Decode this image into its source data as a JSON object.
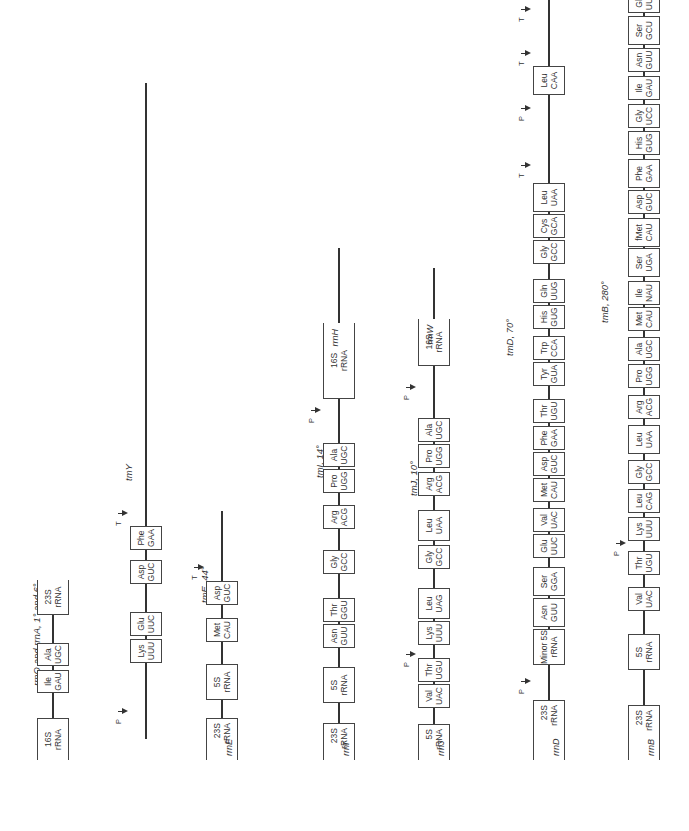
{
  "figure": {
    "operons": [
      {
        "id": "rrnO_rrnA",
        "caption": "rrnO and rrnA, 1° and 6°",
        "caption_x": 145,
        "caption_y": 37,
        "axis_y": 53,
        "line": [
          71,
          251
        ],
        "boxes": [
          {
            "l1": "16S",
            "l2": "rRNA",
            "x": 71,
            "w": 42,
            "open": "left"
          },
          {
            "l1": "Ile",
            "l2": "GAU",
            "x": 138,
            "w": 23
          },
          {
            "l1": "Ala",
            "l2": "UGC",
            "x": 165,
            "w": 23
          },
          {
            "l1": "23S",
            "l2": "rRNA",
            "x": 216,
            "w": 35,
            "open": "right"
          }
        ],
        "markers": []
      },
      {
        "id": "rrnY",
        "caption": "tmY",
        "caption_x": 350,
        "caption_y": 129,
        "axis_y": 146,
        "line": [
          92,
          748
        ],
        "boxes": [
          {
            "l1": "Lys",
            "l2": "UUU",
            "x": 168,
            "w": 24
          },
          {
            "l1": "Glu",
            "l2": "UUC",
            "x": 195,
            "w": 24
          },
          {
            "l1": "Asp",
            "l2": "GUC",
            "x": 247,
            "w": 24
          },
          {
            "l1": "Phe",
            "l2": "GAA",
            "x": 281,
            "w": 24
          }
        ],
        "markers": [
          {
            "type": "P",
            "x": 119
          },
          {
            "type": "T",
            "x": 317
          }
        ]
      },
      {
        "id": "rrnE",
        "caption": "tmE, 44°",
        "caption_x": 228,
        "caption_y": 205,
        "axis_y": 222,
        "line": [
          71,
          320
        ],
        "boxes": [
          {
            "l1": "23S",
            "l2": "rRNA",
            "x": 71,
            "w": 42,
            "open": "left",
            "name": "rrnE"
          },
          {
            "l1": "5S",
            "l2": "rRNA",
            "x": 131,
            "w": 36
          },
          {
            "l1": "Met",
            "l2": "CAU",
            "x": 189,
            "w": 24
          },
          {
            "l1": "Asp",
            "l2": "GUC",
            "x": 226,
            "w": 24
          }
        ],
        "markers": [
          {
            "type": "T",
            "x": 263
          }
        ]
      },
      {
        "id": "rrnI",
        "caption": "tmI, 14°",
        "caption_x": 353,
        "caption_y": 320,
        "axis_y": 339,
        "line": [
          71,
          583
        ],
        "boxes": [
          {
            "l1": "23S",
            "l2": "rRNA",
            "x": 71,
            "w": 37,
            "open": "left",
            "name": "rrnI"
          },
          {
            "l1": "5S",
            "l2": "rRNA",
            "x": 128,
            "w": 36
          },
          {
            "l1": "Asn",
            "l2": "GUU",
            "x": 183,
            "w": 24
          },
          {
            "l1": "Thr",
            "l2": "GGU",
            "x": 209,
            "w": 24
          },
          {
            "l1": "Gly",
            "l2": "GCC",
            "x": 257,
            "w": 24
          },
          {
            "l1": "Arg",
            "l2": "ACG",
            "x": 302,
            "w": 24
          },
          {
            "l1": "Pro",
            "l2": "UGG",
            "x": 338,
            "w": 24
          },
          {
            "l1": "Ala",
            "l2": "UGC",
            "x": 364,
            "w": 24
          }
        ],
        "markers": [
          {
            "type": "P",
            "x": 420
          }
        ],
        "tail_box": {
          "l1": "16S",
          "l2": "rRNA",
          "x": 432,
          "w": 76,
          "open": "right",
          "name": "rrnH"
        }
      },
      {
        "id": "rrnJ",
        "caption": "tmJ, 10°",
        "caption_x": 335,
        "caption_y": 414,
        "axis_y": 434,
        "line": [
          71,
          563
        ],
        "boxes": [
          {
            "l1": "5S",
            "l2": "rRNA",
            "x": 71,
            "w": 36,
            "open": "left",
            "name": "rrnJ"
          },
          {
            "l1": "Val",
            "l2": "UAC",
            "x": 123,
            "w": 24
          },
          {
            "l1": "Thr",
            "l2": "UGU",
            "x": 149,
            "w": 24
          },
          {
            "l1": "Lys",
            "l2": "UUU",
            "x": 186,
            "w": 24
          },
          {
            "l1": "Leu",
            "l2": "UAG",
            "x": 212,
            "w": 31
          },
          {
            "l1": "Gly",
            "l2": "GCC",
            "x": 262,
            "w": 24
          },
          {
            "l1": "Leu",
            "l2": "UAA",
            "x": 290,
            "w": 31
          },
          {
            "l1": "Arg",
            "l2": "ACG",
            "x": 335,
            "w": 24
          },
          {
            "l1": "Pro",
            "l2": "UGG",
            "x": 363,
            "w": 24
          },
          {
            "l1": "Ala",
            "l2": "UGC",
            "x": 389,
            "w": 24
          }
        ],
        "markers": [
          {
            "type": "P",
            "x": 176
          },
          {
            "type": "P",
            "x": 443
          }
        ],
        "tail_box": {
          "l1": "16S",
          "l2": "rRNA",
          "x": 465,
          "w": 47,
          "open": "right",
          "name": "rrnW"
        }
      },
      {
        "id": "rrnD",
        "caption": "tmD, 70°",
        "caption_x": 475,
        "caption_y": 510,
        "axis_y": 549,
        "line": [
          71,
          831
        ],
        "boxes": [
          {
            "l1": "23S",
            "l2": "rRNA",
            "x": 71,
            "w": 60,
            "open": "left",
            "name": "rrnD"
          },
          {
            "l1": "Minor 5S",
            "l2": "rRNA",
            "x": 166,
            "w": 36
          },
          {
            "l1": "Asn",
            "l2": "GUU",
            "x": 204,
            "w": 29
          },
          {
            "l1": "Ser",
            "l2": "GGA",
            "x": 235,
            "w": 29
          },
          {
            "l1": "Glu",
            "l2": "UUC",
            "x": 273,
            "w": 24
          },
          {
            "l1": "Val",
            "l2": "UAC",
            "x": 299,
            "w": 24
          },
          {
            "l1": "Met",
            "l2": "CAU",
            "x": 329,
            "w": 24
          },
          {
            "l1": "Asp",
            "l2": "GUC",
            "x": 355,
            "w": 24
          },
          {
            "l1": "Phe",
            "l2": "GAA",
            "x": 381,
            "w": 24
          },
          {
            "l1": "Thr",
            "l2": "UGU",
            "x": 408,
            "w": 24
          },
          {
            "l1": "Tyr",
            "l2": "GUA",
            "x": 445,
            "w": 24
          },
          {
            "l1": "Trp",
            "l2": "CCA",
            "x": 471,
            "w": 24
          },
          {
            "l1": "His",
            "l2": "GUG",
            "x": 502,
            "w": 24
          },
          {
            "l1": "Gln",
            "l2": "UUG",
            "x": 528,
            "w": 24
          },
          {
            "l1": "Gly",
            "l2": "GCC",
            "x": 567,
            "w": 24
          },
          {
            "l1": "Cys",
            "l2": "GCA",
            "x": 593,
            "w": 24
          },
          {
            "l1": "Leu",
            "l2": "UAA",
            "x": 619,
            "w": 29
          },
          {
            "l1": "Leu",
            "l2": "CAA",
            "x": 736,
            "w": 29
          }
        ],
        "markers": [
          {
            "type": "P",
            "x": 149
          },
          {
            "type": "T",
            "x": 665
          },
          {
            "type": "P",
            "x": 722
          },
          {
            "type": "T",
            "x": 777
          },
          {
            "type": "T",
            "x": 821
          }
        ]
      },
      {
        "id": "rrnB",
        "caption": "tmB, 280°",
        "caption_x": 508,
        "caption_y": 605,
        "axis_y": 644,
        "line": [
          71,
          831
        ],
        "boxes": [
          {
            "l1": "23S",
            "l2": "rRNA",
            "x": 71,
            "w": 55,
            "open": "left",
            "name": "rrnB"
          },
          {
            "l1": "5S",
            "l2": "rRNA",
            "x": 161,
            "w": 36
          },
          {
            "l1": "Val",
            "l2": "UAC",
            "x": 220,
            "w": 24
          },
          {
            "l1": "Thr",
            "l2": "UGU",
            "x": 256,
            "w": 24
          },
          {
            "l1": "Lys",
            "l2": "UUU",
            "x": 290,
            "w": 24
          },
          {
            "l1": "Leu",
            "l2": "CAG",
            "x": 318,
            "w": 24
          },
          {
            "l1": "Gly",
            "l2": "GCC",
            "x": 347,
            "w": 24
          },
          {
            "l1": "Leu",
            "l2": "UAA",
            "x": 377,
            "w": 29
          },
          {
            "l1": "Arg",
            "l2": "ACG",
            "x": 412,
            "w": 24
          },
          {
            "l1": "Pro",
            "l2": "UGG",
            "x": 443,
            "w": 24
          },
          {
            "l1": "Ala",
            "l2": "UGC",
            "x": 470,
            "w": 24
          },
          {
            "l1": "Met",
            "l2": "CAU",
            "x": 500,
            "w": 24
          },
          {
            "l1": "Ile",
            "l2": "NAU",
            "x": 526,
            "w": 24
          },
          {
            "l1": "Ser",
            "l2": "UGA",
            "x": 554,
            "w": 29
          },
          {
            "l1": "fMet",
            "l2": "CAU",
            "x": 584,
            "w": 29
          },
          {
            "l1": "Asp",
            "l2": "GUC",
            "x": 617,
            "w": 24
          },
          {
            "l1": "Phe",
            "l2": "GAA",
            "x": 643,
            "w": 29
          },
          {
            "l1": "His",
            "l2": "GUG",
            "x": 676,
            "w": 24
          },
          {
            "l1": "Gly",
            "l2": "UCC",
            "x": 703,
            "w": 24
          },
          {
            "l1": "Ile",
            "l2": "GAU",
            "x": 731,
            "w": 24
          },
          {
            "l1": "Asn",
            "l2": "GUU",
            "x": 759,
            "w": 24
          },
          {
            "l1": "Ser",
            "l2": "GCU",
            "x": 786,
            "w": 29
          },
          {
            "l1": "Glu",
            "l2": "UUC",
            "x": 818,
            "w": 24
          }
        ],
        "markers": [
          {
            "type": "P",
            "x": 287
          }
        ]
      }
    ]
  }
}
